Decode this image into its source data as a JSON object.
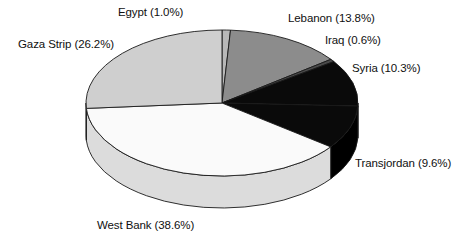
{
  "chart_data": {
    "type": "pie",
    "title": "",
    "subtitle": "",
    "xlabel": "",
    "ylabel": "",
    "legend_position": "none",
    "grid": false,
    "label_format": "name (percent%)",
    "start_angle_deg": 0,
    "direction": "clockwise",
    "three_d": true,
    "categories": [
      "Egypt",
      "Lebanon",
      "Iraq",
      "Syria",
      "Transjordan",
      "West Bank",
      "Gaza Strip"
    ],
    "values": [
      1.0,
      13.8,
      0.6,
      10.3,
      9.6,
      38.6,
      26.2
    ],
    "units": "percent",
    "total": 100.1,
    "slices": [
      {
        "name": "Egypt",
        "value": 1.0,
        "label": "Egypt (1.0%)",
        "percent_text": "1.0%",
        "color": "#b8b8b8",
        "side_color": "#9a9a9a"
      },
      {
        "name": "Lebanon",
        "value": 13.8,
        "label": "Lebanon (13.8%)",
        "percent_text": "13.8%",
        "color": "#8c8c8c",
        "side_color": "#6e6e6e"
      },
      {
        "name": "Iraq",
        "value": 0.6,
        "label": "Iraq (0.6%)",
        "percent_text": "0.6%",
        "color": "#4a4a4a",
        "side_color": "#383838"
      },
      {
        "name": "Syria",
        "value": 10.3,
        "label": "Syria (10.3%)",
        "percent_text": "10.3%",
        "color": "#0a0a0a",
        "side_color": "#000000"
      },
      {
        "name": "Transjordan",
        "value": 9.6,
        "label": "Transjordan (9.6%)",
        "percent_text": "9.6%",
        "color": "#0a0a0a",
        "side_color": "#000000"
      },
      {
        "name": "West Bank",
        "value": 38.6,
        "label": "West Bank (38.6%)",
        "percent_text": "38.6%",
        "color": "#fafafa",
        "side_color": "#dcdcdc"
      },
      {
        "name": "Gaza Strip",
        "value": 26.2,
        "label": "Gaza Strip (26.2%)",
        "percent_text": "26.2%",
        "color": "#cfcfcf",
        "side_color": "#b0b0b0"
      }
    ],
    "geometry": {
      "center_x": 222,
      "center_y": 103,
      "radius_x": 136,
      "radius_y": 73,
      "depth": 32
    },
    "style": {
      "background": "#ffffff",
      "outline": "#1a1a1a",
      "text_color": "#101010"
    }
  }
}
